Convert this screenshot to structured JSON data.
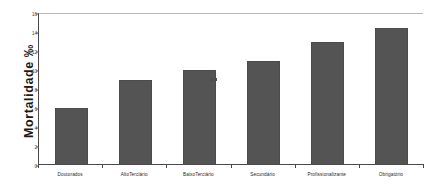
{
  "chart_data": {
    "type": "bar",
    "title": "",
    "subtitle": "",
    "xlabel": "",
    "ylabel": "Mortalidade ‰",
    "categories": [
      "Doutorados",
      "AltoTerciário",
      "BaixoTerciário",
      "Secundário",
      "Profissionalizante",
      "Obrigatório"
    ],
    "values": [
      6,
      9,
      10,
      11,
      13,
      14.4
    ],
    "ylim": [
      0,
      16
    ],
    "ytick_labels": [
      "0",
      "2",
      "4",
      "6",
      "8",
      "10",
      "12",
      "14",
      "16"
    ],
    "ytick_values": [
      0,
      2,
      4,
      6,
      8,
      10,
      12,
      14,
      16
    ],
    "grid": false,
    "legend": null,
    "legend_position": "none",
    "bar_color": "#545454",
    "axis_color": "#4a4a4a",
    "frame_top_color": "#b9b9b9",
    "background": "#ffffff",
    "annotations": [
      {
        "name": "stray-tick-mark",
        "approx_value": 9.2,
        "between_categories": [
          "BaixoTerciário",
          "Secundário"
        ]
      }
    ]
  }
}
